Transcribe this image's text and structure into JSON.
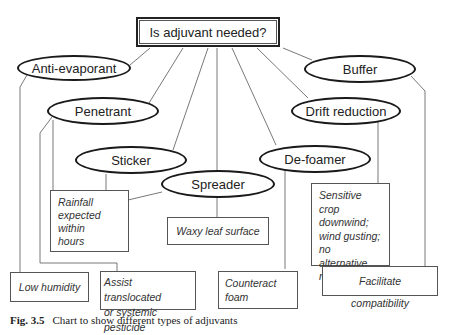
{
  "diagram": {
    "root": {
      "label": "Is adjuvant needed?"
    },
    "types": [
      {
        "id": "anti-evaporant",
        "label": "Anti-evaporant",
        "condition": "Low humidity"
      },
      {
        "id": "penetrant",
        "label": "Penetrant",
        "condition": "Assist translocated or systemic pesticide"
      },
      {
        "id": "sticker",
        "label": "Sticker",
        "condition": "Rainfall expected within hours"
      },
      {
        "id": "spreader",
        "label": "Spreader",
        "condition": "Waxy leaf surface"
      },
      {
        "id": "de-foamer",
        "label": "De-foamer",
        "condition": "Counteract foam"
      },
      {
        "id": "drift-reduction",
        "label": "Drift reduction",
        "condition": "Sensitive crop downwind; wind gusting; no alternative nozzles"
      },
      {
        "id": "buffer",
        "label": "Buffer",
        "condition": "Facilitate compatibility"
      }
    ],
    "condition_lines": {
      "rainfall": [
        "Rainfall",
        "expected",
        "within",
        "hours"
      ],
      "sensitive": [
        "Sensitive crop",
        "downwind;",
        "wind gusting;",
        "no alternative",
        "nozzles"
      ],
      "assist": [
        "Assist translocated",
        "or systemic pesticide"
      ],
      "counteract": [
        "Counteract",
        "foam"
      ]
    }
  },
  "caption": {
    "figure": "Fig. 3.5",
    "text": "Chart to show different types of adjuvants"
  }
}
